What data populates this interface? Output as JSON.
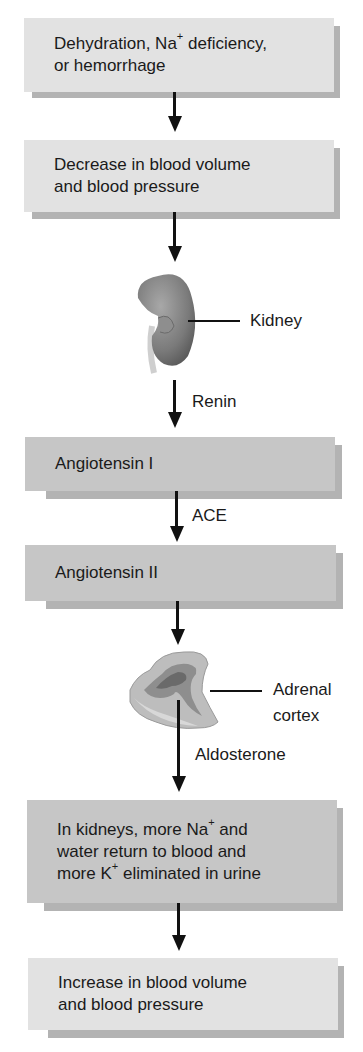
{
  "boxes": [
    {
      "id": "trigger",
      "lines": [
        {
          "pre": "Dehydration, Na",
          "sup": "+",
          "post": " deficiency,"
        },
        {
          "pre": "or hemorrhage"
        }
      ]
    },
    {
      "id": "decrease",
      "lines": [
        {
          "pre": "Decrease in blood volume"
        },
        {
          "pre": "and blood pressure"
        }
      ]
    },
    {
      "id": "angiotensin-1",
      "lines": [
        {
          "pre": "Angiotensin I"
        }
      ]
    },
    {
      "id": "angiotensin-2",
      "lines": [
        {
          "pre": "Angiotensin II"
        }
      ]
    },
    {
      "id": "kidney-effect",
      "lines": [
        {
          "pre": "In kidneys, more Na",
          "sup": "+",
          "post": " and"
        },
        {
          "pre": "water return to blood and"
        },
        {
          "pre": "more K",
          "sup": "+",
          "post": " eliminated in urine"
        }
      ]
    },
    {
      "id": "increase",
      "lines": [
        {
          "pre": "Increase in blood volume"
        },
        {
          "pre": "and blood pressure"
        }
      ]
    }
  ],
  "organs": {
    "kidney": {
      "label": "Kidney"
    },
    "adrenal": {
      "label_line1": "Adrenal",
      "label_line2": "cortex"
    }
  },
  "arrow_labels": {
    "renin": "Renin",
    "ace": "ACE",
    "aldosterone": "Aldosterone"
  },
  "colors": {
    "light_box": "#e2e2e2",
    "dark_box": "#c6c6c6",
    "shadow": "#b3b3b3",
    "arrow": "#111111"
  }
}
